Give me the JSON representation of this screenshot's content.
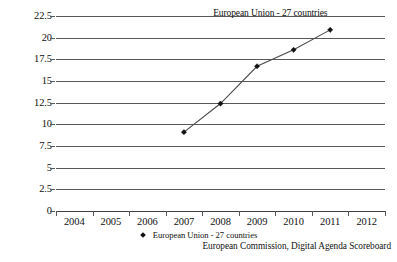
{
  "chart_data": {
    "type": "line",
    "title": "",
    "subtitle": "",
    "xlabel": "",
    "ylabel": "",
    "categories": [
      "2004",
      "2005",
      "2006",
      "2007",
      "2008",
      "2009",
      "2010",
      "2011",
      "2012"
    ],
    "series": [
      {
        "name": "European Union - 27 countries",
        "marker": "diamond",
        "color": "#111111",
        "values": [
          null,
          null,
          null,
          9.1,
          12.4,
          16.7,
          18.6,
          20.9,
          null
        ]
      }
    ],
    "ylim": [
      0,
      22.5
    ],
    "yticks": [
      0,
      2.5,
      5,
      7.5,
      10,
      12.5,
      15,
      17.5,
      20,
      22.5
    ],
    "ytick_labels": [
      "0",
      "2.5",
      "5",
      "7.5",
      "10",
      "12.5",
      "15",
      "17.5",
      "20",
      "22.5"
    ],
    "grid": true,
    "grid_axis": "y",
    "legend": {
      "position": "bottom-center",
      "entries": [
        "European Union - 27 countries"
      ]
    },
    "annotations": [
      {
        "text": "European Union - 27 countries",
        "target_category": "2011",
        "target_value": 20.9
      }
    ],
    "source": "European Commission, Digital Agenda Scoreboard",
    "colors": {
      "background": "#ffffff",
      "gridline": "#595959",
      "line": "#4a4a4a",
      "marker": "#111111",
      "text": "#111111"
    }
  }
}
